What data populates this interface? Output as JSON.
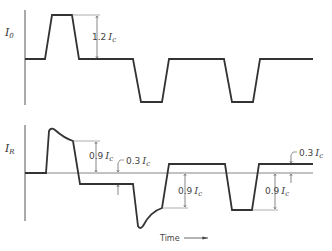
{
  "top_plot": {
    "ylabel": "I",
    "ylabel_sub": "0",
    "annotation": {
      "value": "1.2",
      "symbol": "I",
      "sub": "c"
    }
  },
  "bottom_plot": {
    "ylabel": "I",
    "ylabel_sub": "R",
    "annotations": [
      {
        "value": "0.9",
        "symbol": "I",
        "sub": "c"
      },
      {
        "value": "0.3",
        "symbol": "I",
        "sub": "c"
      },
      {
        "value": "0.9",
        "symbol": "I",
        "sub": "c"
      },
      {
        "value": "0.9",
        "symbol": "I",
        "sub": "c"
      },
      {
        "value": "0.3",
        "symbol": "I",
        "sub": "c"
      }
    ]
  },
  "xaxis": {
    "label": "Time"
  },
  "colors": {
    "trace": "#333333",
    "axis": "#555555"
  }
}
